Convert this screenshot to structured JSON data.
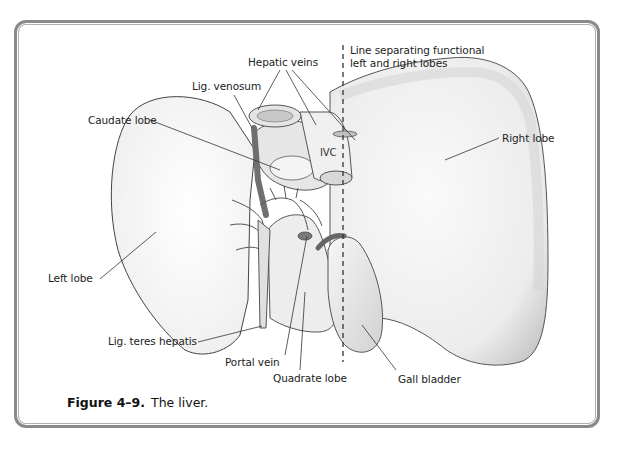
{
  "figure": {
    "number": "Figure 4–9.",
    "title": "The liver."
  },
  "labels": {
    "midline_line_1": "Line separating functional",
    "midline_line_2": "left and right lobes",
    "hepatic_veins": "Hepatic veins",
    "lig_venosum": "Lig. venosum",
    "caudate_lobe": "Caudate lobe",
    "ivc": "IVC",
    "right_lobe": "Right lobe",
    "left_lobe": "Left lobe",
    "lig_teres_hepatis": "Lig. teres hepatis",
    "portal_vein": "Portal vein",
    "quadrate_lobe": "Quadrate lobe",
    "gall_bladder": "Gall bladder"
  },
  "colors": {
    "frame": "#8a8a8a",
    "leader_line": "#333333",
    "organ_fill": "#f2f2f2",
    "organ_shade": "#cfcfcf",
    "vessel_dark": "#6f6f6f"
  }
}
